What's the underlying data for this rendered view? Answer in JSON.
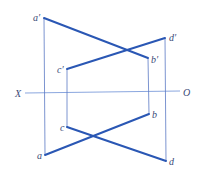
{
  "diagram": {
    "type": "orthographic-projection",
    "axis": {
      "left_label": "X",
      "right_label": "O"
    },
    "colors": {
      "segment": "#2a57b4",
      "projector": "#5b79c4",
      "axis": "#6c8fd6",
      "label": "#3a4a78"
    },
    "points": {
      "a_prime": {
        "label": "a′",
        "x": 44,
        "y": 18
      },
      "b_prime": {
        "label": "b′",
        "x": 148,
        "y": 58
      },
      "c_prime": {
        "label": "c′",
        "x": 67,
        "y": 69
      },
      "d_prime": {
        "label": "d′",
        "x": 165,
        "y": 38
      },
      "a": {
        "label": "a",
        "x": 45,
        "y": 155
      },
      "b": {
        "label": "b",
        "x": 149,
        "y": 114
      },
      "c": {
        "label": "c",
        "x": 67,
        "y": 127
      },
      "d": {
        "label": "d",
        "x": 166,
        "y": 161
      }
    },
    "segments": [
      {
        "from": "a_prime",
        "to": "b_prime",
        "view": "front"
      },
      {
        "from": "c_prime",
        "to": "d_prime",
        "view": "front"
      },
      {
        "from": "a",
        "to": "b",
        "view": "top"
      },
      {
        "from": "c",
        "to": "d",
        "view": "top"
      }
    ]
  }
}
